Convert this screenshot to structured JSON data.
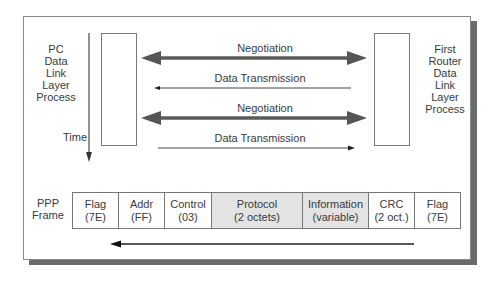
{
  "diagram": {
    "left_process": {
      "lines": [
        "PC",
        "Data",
        "Link",
        "Layer",
        "Process"
      ]
    },
    "right_process": {
      "lines": [
        "First",
        "Router",
        "Data",
        "Link",
        "Layer",
        "Process"
      ]
    },
    "time_label": "Time",
    "exchanges": [
      {
        "label": "Negotiation",
        "style": "thick-bidirectional"
      },
      {
        "label": "Data Transmission",
        "style": "thin-to-left"
      },
      {
        "label": "Negotiation",
        "style": "thick-bidirectional"
      },
      {
        "label": "Data Transmission",
        "style": "thin-to-right"
      }
    ],
    "frame": {
      "label_lines": [
        "PPP",
        "Frame"
      ],
      "fields": [
        {
          "name": "Flag",
          "value": "(7E)",
          "shaded": false
        },
        {
          "name": "Addr",
          "value": "(FF)",
          "shaded": false
        },
        {
          "name": "Control",
          "value": "(03)",
          "shaded": false
        },
        {
          "name": "Protocol",
          "value": "(2 octets)",
          "shaded": true
        },
        {
          "name": "Information",
          "value": "(variable)",
          "shaded": true
        },
        {
          "name": "CRC",
          "value": "(2 oct.)",
          "shaded": false
        },
        {
          "name": "Flag",
          "value": "(7E)",
          "shaded": false
        }
      ],
      "direction": "right-to-left"
    },
    "colors": {
      "thick_arrow": "#5a5a5a",
      "thin_arrow": "#333333",
      "shaded_cell": "#e3e3e3",
      "shadow": "#6b6b6b"
    }
  }
}
